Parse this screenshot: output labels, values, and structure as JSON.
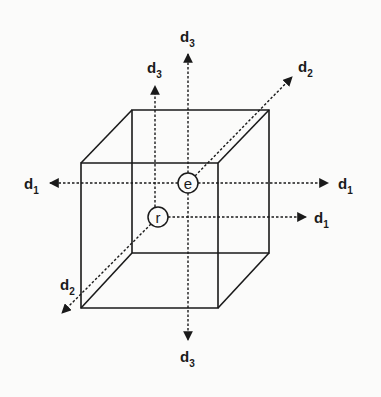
{
  "diagram": {
    "type": "cube-with-axes",
    "colors": {
      "ink": "#1a1a1a",
      "background": "#fbfbfa"
    },
    "cube": {
      "back_face": [
        [
          132,
          110
        ],
        [
          269,
          110
        ],
        [
          269,
          253
        ],
        [
          132,
          253
        ]
      ],
      "front_face": [
        [
          81,
          163
        ],
        [
          218,
          163
        ],
        [
          218,
          308
        ],
        [
          81,
          308
        ]
      ]
    },
    "nodes": [
      {
        "id": "e",
        "label": "e",
        "x": 188,
        "y": 183,
        "r": 10
      },
      {
        "id": "r",
        "label": "r",
        "x": 158,
        "y": 217,
        "r": 10
      }
    ],
    "axes": [
      {
        "id": "d1-left",
        "from": [
          178,
          183
        ],
        "to": [
          50,
          183
        ],
        "label_base": "d",
        "label_sub": "1",
        "label_x": 24,
        "label_y": 189
      },
      {
        "id": "d1-right",
        "from": [
          198,
          183
        ],
        "to": [
          328,
          183
        ],
        "label_base": "d",
        "label_sub": "1",
        "label_x": 338,
        "label_y": 189
      },
      {
        "id": "d1-r",
        "from": [
          168,
          217
        ],
        "to": [
          306,
          217
        ],
        "label_base": "d",
        "label_sub": "1",
        "label_x": 314,
        "label_y": 223
      },
      {
        "id": "d3-up",
        "from": [
          188,
          173
        ],
        "to": [
          188,
          54
        ],
        "label_base": "d",
        "label_sub": "3",
        "label_x": 180,
        "label_y": 42
      },
      {
        "id": "d3-down",
        "from": [
          188,
          193
        ],
        "to": [
          188,
          340
        ],
        "label_base": "d",
        "label_sub": "3",
        "label_x": 180,
        "label_y": 362
      },
      {
        "id": "d3-r",
        "from": [
          155,
          207
        ],
        "to": [
          155,
          86
        ],
        "label_base": "d",
        "label_sub": "3",
        "label_x": 147,
        "label_y": 73
      },
      {
        "id": "d2-up",
        "from": [
          195,
          176
        ],
        "to": [
          292,
          77
        ],
        "label_base": "d",
        "label_sub": "2",
        "label_x": 298,
        "label_y": 72
      },
      {
        "id": "d2-down",
        "from": [
          151,
          224
        ],
        "to": [
          62,
          313
        ],
        "label_base": "d",
        "label_sub": "2",
        "label_x": 60,
        "label_y": 290
      }
    ]
  }
}
